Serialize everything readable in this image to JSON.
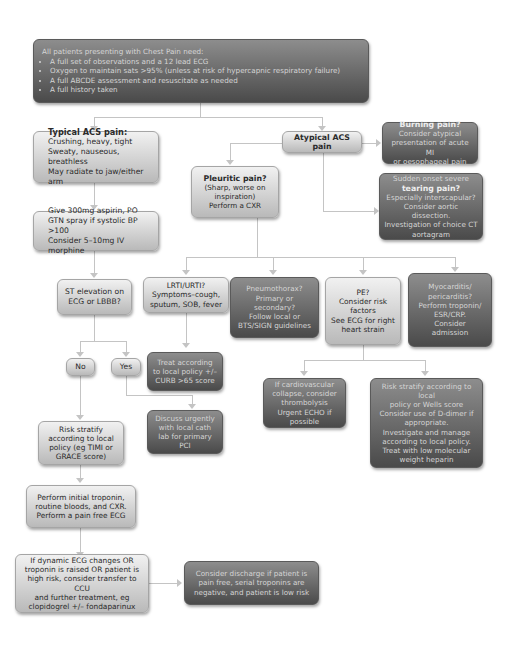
{
  "intro": {
    "heading": "All patients presenting with Chest Pain need:",
    "bullets": [
      "A full set of observations and a 12 lead ECG",
      "Oxygen to maintain sats >95% (unless at risk of hypercapnic respiratory failure)",
      "A full ABCDE assessment and resuscitate as needed",
      "A full history taken"
    ]
  },
  "typical": {
    "title": "Typical ACS pain:",
    "lines": [
      "Crushing, heavy, tight",
      "Sweaty, nauseous, breathless",
      "May radiate to jaw/either arm"
    ]
  },
  "atypical": {
    "title": "Atypical ACS pain"
  },
  "burning": {
    "title": "Burning pain?",
    "lines": [
      "Consider atypical",
      "presentation of acute MI",
      "or oesophageal pain"
    ]
  },
  "tearing": {
    "pre": "Sudden onset severe",
    "title": "tearing pain?",
    "lines": [
      "Especially interscapular?",
      "Consider aortic dissection.",
      "Investigation of choice CT",
      "aortagram"
    ]
  },
  "pleuritic": {
    "title": "Pleuritic pain?",
    "lines": [
      "(Sharp, worse on",
      "inspiration)",
      "Perform a CXR"
    ]
  },
  "treatment": {
    "lines": [
      "Give 300mg aspirin, PO",
      "GTN spray if systolic BP >100",
      "Consider 5–10mg IV morphine"
    ]
  },
  "st": {
    "lines": [
      "ST elevation on",
      "ECG or LBBB?"
    ]
  },
  "lrti": {
    "lines": [
      "LRTI/URTI?",
      "Symptoms–cough,",
      "sputum, SOB, fever"
    ]
  },
  "pneumo": {
    "lines": [
      "Pneumothorax?",
      "Primary or",
      "secondary?",
      "Follow local or",
      "BTS/SIGN guidelines"
    ]
  },
  "pe": {
    "lines": [
      "PE?",
      "Consider risk",
      "factors",
      "See ECG for right",
      "heart strain"
    ]
  },
  "myo": {
    "lines": [
      "Myocarditis/",
      "pericarditis?",
      "Perform troponin/",
      "ESR/CRP.",
      "Consider",
      "admission"
    ]
  },
  "no": {
    "label": "No"
  },
  "yes": {
    "label": "Yes"
  },
  "curb": {
    "lines": [
      "Treat according",
      "to local policy +/–",
      "CURB >65 score"
    ]
  },
  "cath": {
    "lines": [
      "Discuss urgently",
      "with local cath",
      "lab for primary",
      "PCI"
    ]
  },
  "cardio": {
    "lines": [
      "If cardiovascular",
      "collapse, consider",
      "thrombolysis",
      "Urgent ECHO if possible"
    ]
  },
  "wells": {
    "lines": [
      "Risk stratify according to local",
      "policy or Wells score",
      "Consider use of D-dimer if",
      "appropriate.",
      "Investigate and manage",
      "according to local policy.",
      "Treat with low molecular",
      "weight heparin"
    ]
  },
  "risk": {
    "lines": [
      "Risk stratify",
      "according to local",
      "policy (eg TIMI or",
      "GRACE score)"
    ]
  },
  "initial": {
    "lines": [
      "Perform initial troponin,",
      "routine bloods, and CXR.",
      "Perform a pain free ECG"
    ]
  },
  "dynamic": {
    "lines": [
      "If dynamic ECG changes OR",
      "troponin is raised OR patient is",
      "high risk, consider transfer to CCU",
      "and further treatment, eg",
      "clopidogrel +/– fondaparinux"
    ]
  },
  "discharge": {
    "lines": [
      "Consider discharge if patient is",
      "pain free, serial troponins are",
      "negative, and patient is low risk"
    ]
  }
}
